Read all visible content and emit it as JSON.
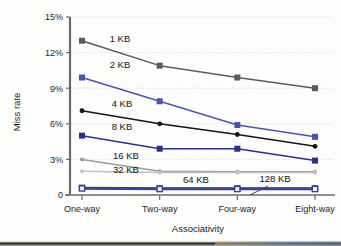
{
  "figure": {
    "background_color": "#fdfdfc",
    "plot": {
      "x0": 70,
      "x1": 327,
      "y_top": 17,
      "y_bottom": 195
    }
  },
  "chart_data": {
    "type": "line",
    "title": "",
    "xlabel": "Associativity",
    "ylabel": "Miss rate",
    "categories": [
      "One-way",
      "Two-way",
      "Four-way",
      "Eight-way"
    ],
    "x_tick_labels": [
      "One-way",
      "Two-way",
      "Four-way",
      "Eight-way"
    ],
    "y_tick_labels": [
      "0",
      "3%",
      "6%",
      "9%",
      "12%",
      "15%"
    ],
    "y_tick_values": [
      0,
      3,
      6,
      9,
      12,
      15
    ],
    "ylim": [
      0,
      15
    ],
    "y_unit": "%",
    "grid": "horizontal",
    "legend": "inline-labels",
    "series": [
      {
        "name": "1 KB",
        "values": [
          13.0,
          10.9,
          9.9,
          9.0
        ],
        "color": "#5b5b5b",
        "marker": "square-filled",
        "label_x": 3,
        "label_y": 13.0
      },
      {
        "name": "2 KB",
        "values": [
          9.9,
          7.9,
          5.9,
          4.9
        ],
        "color": "#4a54b0",
        "marker": "square-filled",
        "label_x": 3,
        "label_y": 9.9
      },
      {
        "name": "4 KB",
        "values": [
          7.1,
          6.0,
          5.1,
          4.1
        ],
        "color": "#141414",
        "marker": "circle-filled",
        "label_x": 3,
        "label_y": 7.1
      },
      {
        "name": "8 KB",
        "values": [
          5.0,
          3.9,
          3.9,
          2.9
        ],
        "color": "#2b2f92",
        "marker": "square-filled",
        "label_x": 3,
        "label_y": 5.0
      },
      {
        "name": "16 KB",
        "values": [
          3.0,
          2.0,
          1.95,
          1.95
        ],
        "color": "#9a9a9a",
        "marker": "circle-small",
        "label_x": 3,
        "label_y": 3.0
      },
      {
        "name": "32 KB",
        "values": [
          2.0,
          1.9,
          1.9,
          1.9
        ],
        "color": "#c2c2c2",
        "marker": "circle-small",
        "label_x": 3,
        "label_y": 2.0
      },
      {
        "name": "64 KB",
        "values": [
          0.6,
          0.55,
          0.55,
          0.55
        ],
        "color": "#2b2f92",
        "marker": "square-open",
        "label_x": 2.6,
        "label_y": 1.05
      },
      {
        "name": "128 KB",
        "values": [
          0.55,
          0.5,
          0.5,
          0.5
        ],
        "color": "#3a40a0",
        "marker": "square-open",
        "label_x": 3.6,
        "label_y": 1.05
      }
    ],
    "annotations": [
      {
        "text": "1 KB",
        "x_px": 120,
        "y_px": 42
      },
      {
        "text": "2 KB",
        "x_px": 120,
        "y_px": 68
      },
      {
        "text": "4 KB",
        "x_px": 122,
        "y_px": 107
      },
      {
        "text": "8 KB",
        "x_px": 122,
        "y_px": 130
      },
      {
        "text": "16 KB",
        "x_px": 126,
        "y_px": 159
      },
      {
        "text": "32 KB",
        "x_px": 126,
        "y_px": 173
      },
      {
        "text": "64 KB",
        "x_px": 196,
        "y_px": 183
      },
      {
        "text": "128 KB",
        "x_px": 275,
        "y_px": 182
      }
    ],
    "leader_line": {
      "from_x_px": 268,
      "from_y_px": 186,
      "to_x_px": 250,
      "to_y_px": 195
    }
  },
  "axes": {
    "y_label": "Miss rate",
    "x_label": "Associativity",
    "y_ticks": [
      "15%",
      "12%",
      "9%",
      "6%",
      "3%",
      "0"
    ],
    "x_ticks": [
      "One-way",
      "Two-way",
      "Four-way",
      "Eight-way"
    ]
  },
  "colors": {
    "axis": "#6b6b6b",
    "grid": "#d8d8d8",
    "text": "#1d1d1d",
    "series_1kb": "#5b5b5b",
    "series_2kb": "#4a54b0",
    "series_4kb": "#141414",
    "series_8kb": "#2b2f92",
    "series_16kb": "#9a9a9a",
    "series_32kb": "#c2c2c2",
    "series_64kb": "#2b2f92",
    "series_128kb": "#3a40a0"
  }
}
